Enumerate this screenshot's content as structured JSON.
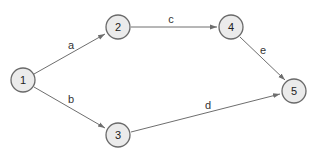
{
  "diagram": {
    "type": "directed-graph",
    "nodes": [
      {
        "id": "1",
        "label": "1",
        "x": 23,
        "y": 80
      },
      {
        "id": "2",
        "label": "2",
        "x": 118,
        "y": 27
      },
      {
        "id": "3",
        "label": "3",
        "x": 118,
        "y": 135
      },
      {
        "id": "4",
        "label": "4",
        "x": 231,
        "y": 27
      },
      {
        "id": "5",
        "label": "5",
        "x": 294,
        "y": 91
      }
    ],
    "edges": [
      {
        "id": "a",
        "label": "a",
        "from": "1",
        "to": "2"
      },
      {
        "id": "b",
        "label": "b",
        "from": "1",
        "to": "3"
      },
      {
        "id": "c",
        "label": "c",
        "from": "2",
        "to": "4"
      },
      {
        "id": "d",
        "label": "d",
        "from": "3",
        "to": "5"
      },
      {
        "id": "e",
        "label": "e",
        "from": "4",
        "to": "5"
      }
    ],
    "colors": {
      "node_fill": "#ebebeb",
      "node_stroke": "#6a6a6a",
      "edge": "#6e6e6e"
    }
  }
}
